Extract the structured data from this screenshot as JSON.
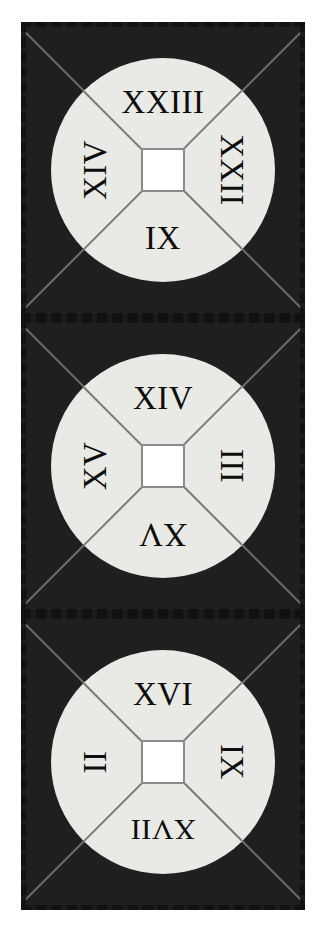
{
  "figure": {
    "panel_count": 3,
    "colors": {
      "page_background": "#ffffff",
      "panel_background": "#201f1f",
      "panel_border": "#111111",
      "disc_fill": "#e9e9e6",
      "line": "#7a7a7a",
      "diagonal": "#6d6d6d",
      "center_fill": "#ffffff",
      "center_border": "#8a8a8a",
      "numeral_color": "#0d0d0d"
    }
  },
  "panels": [
    {
      "id": "panel-1",
      "position": "top",
      "sectors": {
        "top": {
          "label": "XXIII",
          "value": 23,
          "rotation": 0
        },
        "right": {
          "label": "XXII",
          "value": 22,
          "rotation": 90
        },
        "bottom": {
          "label": "IX",
          "value": 9,
          "rotation": 0
        },
        "left": {
          "label": "XIV",
          "value": 14,
          "rotation": -90
        }
      }
    },
    {
      "id": "panel-2",
      "position": "middle",
      "sectors": {
        "top": {
          "label": "XIV",
          "value": 14,
          "rotation": 0
        },
        "right": {
          "label": "III",
          "value": 3,
          "rotation": 90
        },
        "bottom": {
          "label": "XV",
          "value": 15,
          "rotation": 180
        },
        "left": {
          "label": "XV",
          "value": 15,
          "rotation": -90
        }
      }
    },
    {
      "id": "panel-3",
      "position": "bottom",
      "sectors": {
        "top": {
          "label": "XVI",
          "value": 16,
          "rotation": 0
        },
        "right": {
          "label": "IX",
          "value": 9,
          "rotation": 90
        },
        "bottom": {
          "label": "XVII",
          "value": 17,
          "rotation": 180
        },
        "left": {
          "label": "II",
          "value": 2,
          "rotation": -90
        }
      }
    }
  ]
}
